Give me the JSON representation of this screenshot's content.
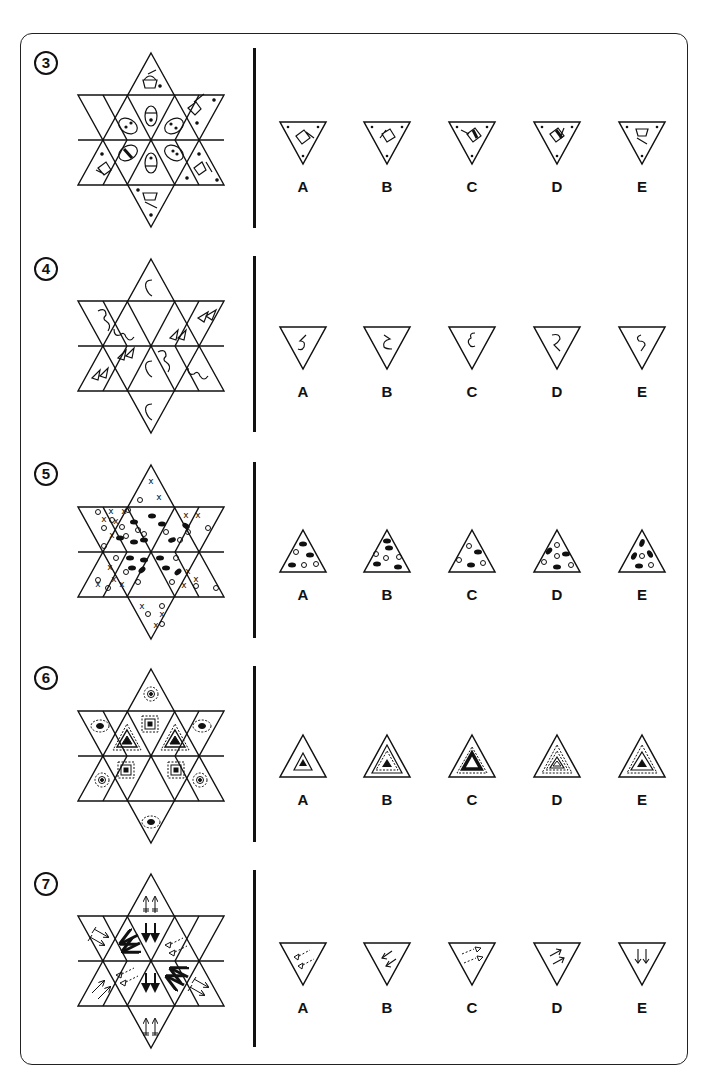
{
  "page": {
    "frame": {
      "border_color": "#222222",
      "background": "#ffffff"
    }
  },
  "puzzles": [
    {
      "number": "3",
      "theme": "cupcake-and-egg",
      "grid_description": "Six-pointed star made of 12 triangles; outer triangles contain cupcake shapes with dots, inner triangles contain eggs with stripes and dots",
      "options": [
        {
          "label": "A",
          "description": "inverted triangle, rotated cupcake with dotted band, 3 corner dots"
        },
        {
          "label": "B",
          "description": "inverted triangle, cupcake tilted with dotted band, 3 corner dots"
        },
        {
          "label": "C",
          "description": "inverted triangle, cupcake with solid band, 3 corner dots"
        },
        {
          "label": "D",
          "description": "inverted triangle, cupcake with solid band rotated, 3 corner dots"
        },
        {
          "label": "E",
          "description": "inverted triangle, upright cupcake, 3 corner dots"
        }
      ]
    },
    {
      "number": "4",
      "theme": "curved-symbols",
      "grid_description": "Star with S-curves, wavy 3-like curves and double triangle arrows",
      "options": [
        {
          "label": "A",
          "description": "inverted triangle containing 5-shaped curve"
        },
        {
          "label": "B",
          "description": "inverted triangle containing 2-shaped curve"
        },
        {
          "label": "C",
          "description": "inverted triangle containing epsilon-shaped curve"
        },
        {
          "label": "D",
          "description": "inverted triangle containing mirrored 2-curve"
        },
        {
          "label": "E",
          "description": "inverted triangle containing mirrored S-curve"
        }
      ]
    },
    {
      "number": "5",
      "theme": "x-circles-ovals",
      "grid_description": "Star with X marks, hollow circles and black ovals; one centre triangle empty",
      "options": [
        {
          "label": "A",
          "description": "upright triangle, 3 black ovals, 3 circles"
        },
        {
          "label": "B",
          "description": "upright triangle, 4 black ovals, 3 circles"
        },
        {
          "label": "C",
          "description": "upright triangle, 2 black ovals, 3 circles"
        },
        {
          "label": "D",
          "description": "upright triangle, 3 black ovals, 4 circles"
        },
        {
          "label": "E",
          "description": "upright triangle, 4 black ovals, 2 circles"
        }
      ]
    },
    {
      "number": "6",
      "theme": "nested-shapes",
      "grid_description": "Star with dashed-ring dots, nested squares and nested triangles; one centre triangle empty",
      "options": [
        {
          "label": "A",
          "description": "upright triangle, inner solid triangle with black core"
        },
        {
          "label": "B",
          "description": "upright triangle, solid + dashed rings with black core"
        },
        {
          "label": "C",
          "description": "upright triangle, dashed ring, thick black outline core"
        },
        {
          "label": "D",
          "description": "upright triangle, dashed + double solid rings, hollow core"
        },
        {
          "label": "E",
          "description": "upright triangle, dashed ring + solid ring, black core"
        }
      ]
    },
    {
      "number": "7",
      "theme": "arrows",
      "grid_description": "Star with paired arrows of various styles (barred, bold, hollow, dashed triangle tails)",
      "options": [
        {
          "label": "A",
          "description": "inverted triangle, two hollow triangles with dashed tails"
        },
        {
          "label": "B",
          "description": "inverted triangle, two arrows pointing down-left"
        },
        {
          "label": "C",
          "description": "inverted triangle, dashed lines ending in triangles pointing right"
        },
        {
          "label": "D",
          "description": "inverted triangle, two arrows pointing up-right"
        },
        {
          "label": "E",
          "description": "inverted triangle, two thin arrows pointing down"
        }
      ]
    }
  ]
}
